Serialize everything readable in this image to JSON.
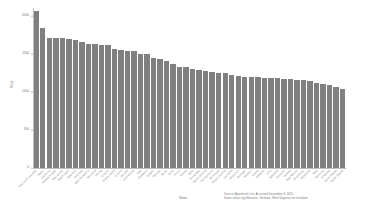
{
  "chart_data": {
    "type": "bar",
    "title": "",
    "xlabel": "State",
    "ylabel": "Rent",
    "ylim": [
      0,
      2100
    ],
    "grid": false,
    "legend": null,
    "bar_color": "#808080",
    "y_ticks": [
      {
        "value": 0,
        "label": "0"
      },
      {
        "value": 500,
        "label": "500"
      },
      {
        "value": 1000,
        "label": "1000"
      },
      {
        "value": 1500,
        "label": "1500"
      },
      {
        "value": 2000,
        "label": "2000"
      }
    ],
    "categories": [
      "District of Columbia",
      "Hawaii",
      "California",
      "Massachusetts",
      "New Jersey",
      "Washington",
      "New York",
      "Colorado",
      "New Hampshire",
      "Maryland",
      "Florida",
      "Virginia",
      "Rhode Island",
      "Arizona",
      "Nevada",
      "Connecticut",
      "Utah",
      "Delaware",
      "Oregon",
      "Georgia",
      "Maine",
      "Texas",
      "Illinois",
      "Alaska",
      "Idaho",
      "Tennessee",
      "North Carolina",
      "Pennsylvania",
      "Minnesota",
      "South Carolina",
      "Louisiana",
      "Wisconsin",
      "Michigan",
      "Missouri",
      "Indiana",
      "Alabama",
      "Ohio",
      "Nebraska",
      "Kentucky",
      "Kansas",
      "New Mexico",
      "Mississippi",
      "Oklahoma",
      "Iowa",
      "Wyoming",
      "Arkansas",
      "North Dakota",
      "South Dakota"
    ],
    "values": [
      2060,
      1840,
      1700,
      1700,
      1700,
      1690,
      1675,
      1660,
      1630,
      1625,
      1620,
      1615,
      1560,
      1545,
      1540,
      1530,
      1500,
      1490,
      1445,
      1430,
      1410,
      1360,
      1330,
      1320,
      1300,
      1290,
      1275,
      1260,
      1250,
      1245,
      1215,
      1205,
      1200,
      1195,
      1190,
      1185,
      1180,
      1175,
      1170,
      1165,
      1155,
      1150,
      1145,
      1120,
      1105,
      1090,
      1060,
      1035
    ]
  },
  "footnote": {
    "line1": "Source: Apartment List, Accessed December 4, 2021.",
    "line2": "Some states (eg Montana, Vermont, West Virginia) not included."
  }
}
